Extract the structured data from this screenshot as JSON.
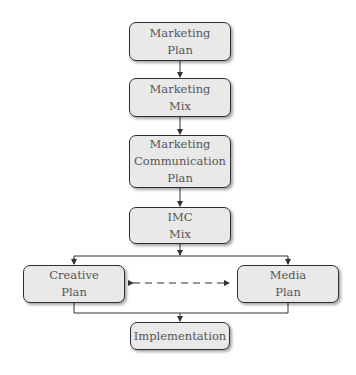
{
  "diagram": {
    "type": "flowchart",
    "nodes": [
      {
        "id": "marketing-plan",
        "lines": [
          "Marketing",
          "Plan"
        ]
      },
      {
        "id": "marketing-mix",
        "lines": [
          "Marketing",
          "Mix"
        ]
      },
      {
        "id": "marketing-communication-plan",
        "lines": [
          "Marketing",
          "Communication",
          "Plan"
        ]
      },
      {
        "id": "imc-mix",
        "lines": [
          "IMC",
          "Mix"
        ]
      },
      {
        "id": "creative-plan",
        "lines": [
          "Creative",
          "Plan"
        ]
      },
      {
        "id": "media-plan",
        "lines": [
          "Media",
          "Plan"
        ]
      },
      {
        "id": "implementation",
        "lines": [
          "Implementation"
        ]
      }
    ],
    "edges": [
      {
        "from": "marketing-plan",
        "to": "marketing-mix",
        "style": "solid"
      },
      {
        "from": "marketing-mix",
        "to": "marketing-communication-plan",
        "style": "solid"
      },
      {
        "from": "marketing-communication-plan",
        "to": "imc-mix",
        "style": "solid"
      },
      {
        "from": "imc-mix",
        "to": "creative-plan",
        "style": "solid"
      },
      {
        "from": "imc-mix",
        "to": "media-plan",
        "style": "solid"
      },
      {
        "from": "creative-plan",
        "to": "media-plan",
        "style": "dashed",
        "bidirectional": true
      },
      {
        "from": "creative-plan",
        "to": "implementation",
        "style": "solid"
      },
      {
        "from": "media-plan",
        "to": "implementation",
        "style": "solid"
      }
    ],
    "colors": {
      "box_fill": "#e9e9e9",
      "box_border": "#2e2e2e",
      "text": "#555555",
      "line": "#333333"
    }
  }
}
